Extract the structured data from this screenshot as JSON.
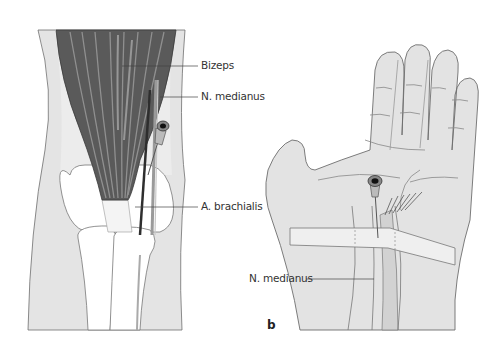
{
  "figure": {
    "panel_a": {
      "labels": [
        {
          "id": "bizeps",
          "text": "Bizeps"
        },
        {
          "id": "n-medianus",
          "text": "N. medianus"
        },
        {
          "id": "a-brachialis",
          "text": "A. brachialis"
        }
      ]
    },
    "panel_b": {
      "letter": "b",
      "labels": [
        {
          "id": "n-medianus",
          "text": "N. medianus"
        }
      ]
    }
  },
  "colors": {
    "skin": "#e6e6e6",
    "skin_outline": "#6e6e6e",
    "muscle_dark": "#555555",
    "muscle_light": "#a8a8a8",
    "bone": "#ffffff",
    "leader_line": "#444444"
  }
}
